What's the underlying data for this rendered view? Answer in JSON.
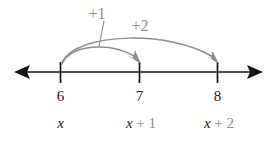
{
  "figure": {
    "kind": "number-line-diagram",
    "background_color": "#ffffff",
    "axis_color": "#161616",
    "accent_color": "#8f8f8f",
    "text_color": "#1a1a1a"
  },
  "number_line": {
    "left_arrow_label": "left-arrowhead",
    "right_arrow_label": "right-arrowhead",
    "ticks": [
      {
        "number_label": "6",
        "expression_variable": "x",
        "expression_rest": "",
        "expression_full": "x"
      },
      {
        "number_label": "7",
        "expression_variable": "x",
        "expression_rest": " + 1",
        "expression_full": "x + 1"
      },
      {
        "number_label": "8",
        "expression_variable": "x",
        "expression_rest": " + 2",
        "expression_full": "x + 2"
      }
    ]
  },
  "jumps": [
    {
      "label": "+1",
      "from_number": "6",
      "to_number": "7",
      "has_leader_line": true
    },
    {
      "label": "+2",
      "from_number": "6",
      "to_number": "8",
      "has_leader_line": false
    }
  ]
}
